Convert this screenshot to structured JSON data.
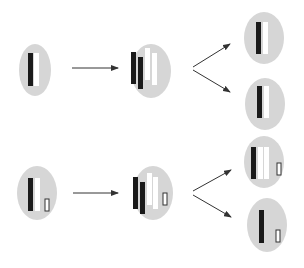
{
  "diagram": {
    "type": "cell-division-schematic",
    "colors": {
      "cell_fill": "#d6d6d6",
      "dark_strand": "#1a1a1a",
      "light_strand": "#ffffff",
      "small_strand_outline": "#333333",
      "arrow": "#333333"
    },
    "rows": [
      {
        "id": "row-1",
        "parent_cell": {
          "cx": 35,
          "cy": 70,
          "rx": 16,
          "ry": 26,
          "strands": [
            {
              "x": 28,
              "y": 53,
              "w": 5,
              "h": 33,
              "kind": "dark"
            },
            {
              "x": 34,
              "y": 53,
              "w": 5,
              "h": 33,
              "kind": "light"
            }
          ]
        },
        "arrow": {
          "x1": 72,
          "y1": 68,
          "x2": 118,
          "y2": 68
        },
        "replicated_cell": {
          "cx": 151,
          "cy": 71,
          "rx": 20,
          "ry": 27,
          "strands": [
            {
              "x": 131,
              "y": 52,
              "w": 5,
              "h": 32,
              "kind": "dark"
            },
            {
              "x": 138,
              "y": 57,
              "w": 5,
              "h": 32,
              "kind": "dark"
            },
            {
              "x": 145,
              "y": 48,
              "w": 5,
              "h": 32,
              "kind": "light"
            },
            {
              "x": 152,
              "y": 53,
              "w": 5,
              "h": 32,
              "kind": "light"
            }
          ]
        },
        "split_arrows": [
          {
            "x1": 193,
            "y1": 67,
            "x2": 230,
            "y2": 44
          },
          {
            "x1": 193,
            "y1": 70,
            "x2": 230,
            "y2": 92
          }
        ],
        "daughter_cells": [
          {
            "cx": 264,
            "cy": 38,
            "rx": 20,
            "ry": 26,
            "strands": [
              {
                "x": 256,
                "y": 22,
                "w": 5,
                "h": 32,
                "kind": "dark"
              },
              {
                "x": 263,
                "y": 22,
                "w": 5,
                "h": 32,
                "kind": "light"
              }
            ]
          },
          {
            "cx": 265,
            "cy": 104,
            "rx": 20,
            "ry": 26,
            "strands": [
              {
                "x": 257,
                "y": 86,
                "w": 5,
                "h": 32,
                "kind": "dark"
              },
              {
                "x": 264,
                "y": 86,
                "w": 5,
                "h": 32,
                "kind": "light"
              }
            ]
          }
        ]
      },
      {
        "id": "row-2",
        "parent_cell": {
          "cx": 37,
          "cy": 193,
          "rx": 20,
          "ry": 27,
          "strands": [
            {
              "x": 28,
              "y": 178,
              "w": 5,
              "h": 33,
              "kind": "dark"
            },
            {
              "x": 35,
              "y": 178,
              "w": 5,
              "h": 33,
              "kind": "light"
            },
            {
              "x": 45,
              "y": 199,
              "w": 4,
              "h": 12,
              "kind": "small"
            }
          ]
        },
        "arrow": {
          "x1": 73,
          "y1": 193,
          "x2": 118,
          "y2": 193
        },
        "replicated_cell": {
          "cx": 153,
          "cy": 193,
          "rx": 20,
          "ry": 27,
          "strands": [
            {
              "x": 133,
              "y": 177,
              "w": 5,
              "h": 32,
              "kind": "dark"
            },
            {
              "x": 140,
              "y": 182,
              "w": 5,
              "h": 32,
              "kind": "dark"
            },
            {
              "x": 147,
              "y": 173,
              "w": 5,
              "h": 32,
              "kind": "light"
            },
            {
              "x": 153,
              "y": 177,
              "w": 5,
              "h": 32,
              "kind": "light"
            },
            {
              "x": 163,
              "y": 193,
              "w": 4,
              "h": 12,
              "kind": "small"
            }
          ]
        },
        "split_arrows": [
          {
            "x1": 193,
            "y1": 191,
            "x2": 231,
            "y2": 170
          },
          {
            "x1": 193,
            "y1": 195,
            "x2": 231,
            "y2": 217
          }
        ],
        "daughter_cells": [
          {
            "cx": 264,
            "cy": 162,
            "rx": 20,
            "ry": 26,
            "strands": [
              {
                "x": 251,
                "y": 147,
                "w": 5,
                "h": 32,
                "kind": "dark"
              },
              {
                "x": 258,
                "y": 147,
                "w": 5,
                "h": 32,
                "kind": "light"
              },
              {
                "x": 264,
                "y": 147,
                "w": 5,
                "h": 32,
                "kind": "light"
              },
              {
                "x": 277,
                "y": 163,
                "w": 4,
                "h": 12,
                "kind": "small"
              }
            ]
          },
          {
            "cx": 267,
            "cy": 225,
            "rx": 20,
            "ry": 27,
            "strands": [
              {
                "x": 259,
                "y": 210,
                "w": 5,
                "h": 33,
                "kind": "dark"
              },
              {
                "x": 276,
                "y": 230,
                "w": 4,
                "h": 12,
                "kind": "small"
              }
            ]
          }
        ]
      }
    ]
  }
}
